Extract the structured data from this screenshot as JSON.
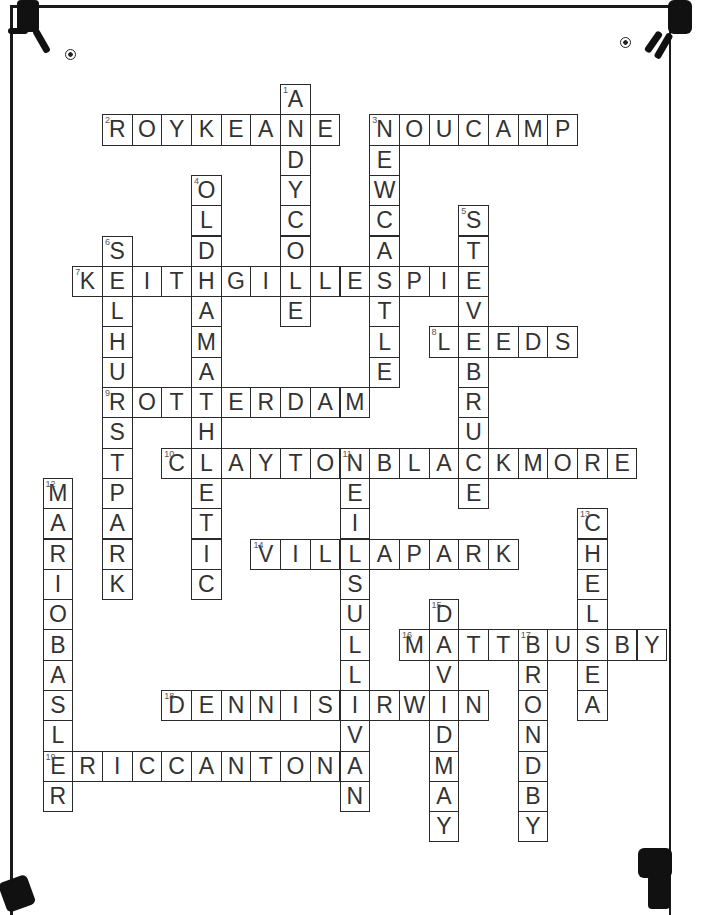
{
  "puzzle": {
    "type": "crossword",
    "theme": "football",
    "grid": {
      "origin_x": 42.5,
      "origin_y": 84,
      "cell_w": 29.7,
      "cell_h": 30.3
    },
    "words": [
      {
        "number": 1,
        "answer": "ANDYCOLE",
        "direction": "down",
        "col": 8,
        "row": 0
      },
      {
        "number": 2,
        "answer": "ROYKEANE",
        "direction": "across",
        "col": 2,
        "row": 1
      },
      {
        "number": 3,
        "answer": "NEWCASTLE",
        "direction": "down",
        "col": 11,
        "row": 1
      },
      {
        "number": 3,
        "answer": "NOUCAMP",
        "direction": "across",
        "col": 11,
        "row": 1
      },
      {
        "number": 4,
        "answer": "OLDHAMATHLETIC",
        "direction": "down",
        "col": 5,
        "row": 3
      },
      {
        "number": 5,
        "answer": "STEVEBRUCE",
        "direction": "down",
        "col": 14,
        "row": 4
      },
      {
        "number": 6,
        "answer": "SELHURSTPARK",
        "direction": "down",
        "col": 2,
        "row": 5
      },
      {
        "number": 7,
        "answer": "KEITHGILLESPIE",
        "direction": "across",
        "col": 1,
        "row": 6
      },
      {
        "number": 8,
        "answer": "LEEDS",
        "direction": "across",
        "col": 13,
        "row": 8
      },
      {
        "number": 9,
        "answer": "ROTTERDAM",
        "direction": "across",
        "col": 2,
        "row": 10
      },
      {
        "number": 10,
        "answer": "CLAYTONBLACKMORE",
        "direction": "across",
        "col": 4,
        "row": 12
      },
      {
        "number": 11,
        "answer": "NEILSULLIVAN",
        "direction": "down",
        "col": 10,
        "row": 12
      },
      {
        "number": 12,
        "answer": "MARIOBASLER",
        "direction": "down",
        "col": 0,
        "row": 13
      },
      {
        "number": 13,
        "answer": "CHELSEA",
        "direction": "down",
        "col": 18,
        "row": 14
      },
      {
        "number": 14,
        "answer": "VILLAPARK",
        "direction": "across",
        "col": 7,
        "row": 15
      },
      {
        "number": 15,
        "answer": "DAVIDMAY",
        "direction": "down",
        "col": 13,
        "row": 17
      },
      {
        "number": 16,
        "answer": "MATTBUSBY",
        "direction": "across",
        "col": 12,
        "row": 18
      },
      {
        "number": 17,
        "answer": "BRONDBY",
        "direction": "down",
        "col": 16,
        "row": 18
      },
      {
        "number": 18,
        "answer": "DENNISIRWIN",
        "direction": "across",
        "col": 4,
        "row": 20
      },
      {
        "number": 19,
        "answer": "ERICCANTONA",
        "direction": "across",
        "col": 0,
        "row": 22
      }
    ]
  },
  "decorations": {
    "corner_icons": [
      "footballer-top-left",
      "footballer-top-right",
      "footballer-bottom-left",
      "footballer-bottom-right"
    ],
    "ball_icons": [
      "football-top-left",
      "football-top-right"
    ]
  }
}
